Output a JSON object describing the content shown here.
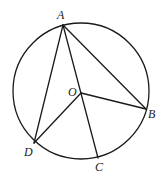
{
  "diagram": {
    "type": "circle-geometry",
    "circle": {
      "center_label": "O",
      "cx": 81,
      "cy": 91,
      "r": 68
    },
    "points": {
      "A": {
        "label": "A",
        "x": 63,
        "y": 25,
        "lx": 57,
        "ly": 19
      },
      "B": {
        "label": "B",
        "x": 146,
        "y": 109,
        "lx": 148,
        "ly": 118
      },
      "C": {
        "label": "C",
        "x": 98,
        "y": 158,
        "lx": 95,
        "ly": 171
      },
      "D": {
        "label": "D",
        "x": 34,
        "y": 143,
        "lx": 24,
        "ly": 156
      },
      "O": {
        "label": "O",
        "x": 81,
        "y": 93,
        "lx": 68,
        "ly": 96
      }
    },
    "segments": [
      "AB",
      "AD",
      "AC",
      "OB",
      "OD"
    ],
    "colors": {
      "stroke": "#1a1a1a",
      "label": "#222222",
      "background": "#ffffff"
    }
  }
}
